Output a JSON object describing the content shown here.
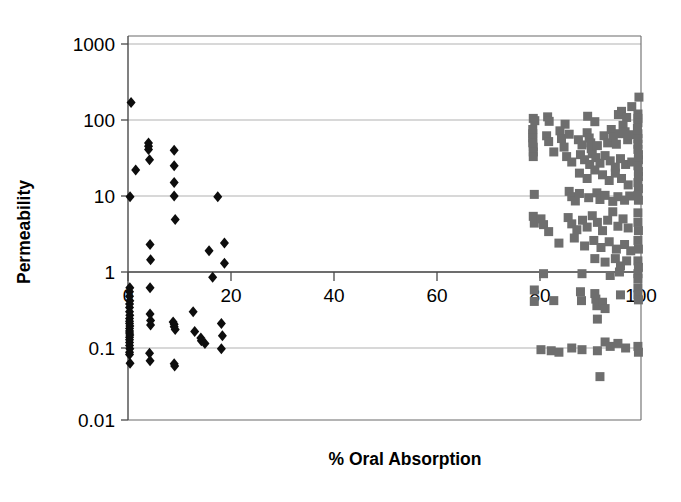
{
  "chart_data": {
    "type": "scatter",
    "title": "",
    "xlabel": "% Oral Absorption",
    "ylabel": "Permeability",
    "xlim": [
      0,
      100
    ],
    "ylim": [
      0.01,
      1000
    ],
    "yscale": "log",
    "xscale": "linear",
    "grid": true,
    "legend": "none",
    "xticks": [
      0,
      20,
      40,
      60,
      80,
      100
    ],
    "xtick_labels": [
      "0",
      "20",
      "40",
      "60",
      "80",
      "100"
    ],
    "yticks": [
      0.01,
      0.1,
      1,
      10,
      100,
      1000
    ],
    "ytick_labels": [
      "0.01",
      "0.1",
      "1",
      "10",
      "100",
      "1000"
    ],
    "series": [
      {
        "name": "low-absorption-compounds",
        "marker": "diamond",
        "color": "#0d0d0d",
        "points": [
          [
            0.6,
            170
          ],
          [
            0.4,
            9.8
          ],
          [
            1.5,
            22
          ],
          [
            4.0,
            50
          ],
          [
            4.0,
            45
          ],
          [
            4.0,
            41
          ],
          [
            4.2,
            30
          ],
          [
            9.0,
            40
          ],
          [
            9.0,
            25
          ],
          [
            9.0,
            15
          ],
          [
            9.0,
            10
          ],
          [
            9.2,
            4.9
          ],
          [
            17.5,
            9.8
          ],
          [
            4.3,
            2.3
          ],
          [
            4.4,
            1.45
          ],
          [
            15.8,
            1.9
          ],
          [
            18.8,
            2.4
          ],
          [
            18.8,
            1.3
          ],
          [
            16.5,
            0.85
          ],
          [
            4.3,
            0.62
          ],
          [
            0.35,
            0.62
          ],
          [
            0.3,
            0.55
          ],
          [
            0.3,
            0.48
          ],
          [
            0.35,
            0.42
          ],
          [
            0.3,
            0.38
          ],
          [
            0.3,
            0.34
          ],
          [
            0.3,
            0.3
          ],
          [
            0.35,
            0.27
          ],
          [
            0.3,
            0.245
          ],
          [
            0.3,
            0.225
          ],
          [
            0.3,
            0.21
          ],
          [
            0.35,
            0.195
          ],
          [
            0.3,
            0.18
          ],
          [
            0.3,
            0.168
          ],
          [
            0.3,
            0.158
          ],
          [
            0.35,
            0.148
          ],
          [
            0.3,
            0.138
          ],
          [
            0.3,
            0.128
          ],
          [
            0.3,
            0.118
          ],
          [
            0.3,
            0.108
          ],
          [
            0.35,
            0.098
          ],
          [
            0.3,
            0.088
          ],
          [
            0.3,
            0.082
          ],
          [
            0.4,
            0.063
          ],
          [
            4.3,
            0.28
          ],
          [
            4.4,
            0.23
          ],
          [
            4.4,
            0.2
          ],
          [
            4.2,
            0.085
          ],
          [
            4.3,
            0.068
          ],
          [
            8.8,
            0.22
          ],
          [
            9.0,
            0.205
          ],
          [
            9.0,
            0.19
          ],
          [
            9.2,
            0.175
          ],
          [
            9.0,
            0.062
          ],
          [
            9.1,
            0.058
          ],
          [
            12.7,
            0.3
          ],
          [
            13.0,
            0.165
          ],
          [
            14.2,
            0.135
          ],
          [
            14.3,
            0.125
          ],
          [
            15.0,
            0.115
          ],
          [
            18.2,
            0.21
          ],
          [
            18.4,
            0.145
          ],
          [
            18.2,
            0.098
          ]
        ]
      },
      {
        "name": "high-absorption-compounds",
        "marker": "square",
        "color": "#6e6e6e",
        "points": [
          [
            99.6,
            200
          ],
          [
            98.2,
            150
          ],
          [
            79.0,
            105
          ],
          [
            79.3,
            98
          ],
          [
            81.8,
            110
          ],
          [
            82.1,
            96
          ],
          [
            85.2,
            88
          ],
          [
            89.6,
            112
          ],
          [
            91.0,
            95
          ],
          [
            95.6,
            118
          ],
          [
            96.2,
            130
          ],
          [
            97.2,
            108
          ],
          [
            99.4,
            120
          ],
          [
            99.4,
            105
          ],
          [
            99.4,
            92
          ],
          [
            78.9,
            75
          ],
          [
            78.9,
            66
          ],
          [
            78.9,
            58
          ],
          [
            78.9,
            50
          ],
          [
            79.0,
            44
          ],
          [
            79.0,
            38
          ],
          [
            79.0,
            33
          ],
          [
            81.6,
            62
          ],
          [
            82.0,
            52
          ],
          [
            84.2,
            72
          ],
          [
            84.5,
            57
          ],
          [
            85.0,
            44
          ],
          [
            86.0,
            65
          ],
          [
            87.8,
            55
          ],
          [
            88.5,
            47
          ],
          [
            89.5,
            68
          ],
          [
            89.9,
            58
          ],
          [
            90.2,
            50
          ],
          [
            90.3,
            42
          ],
          [
            90.5,
            36
          ],
          [
            91.5,
            46
          ],
          [
            92.8,
            62
          ],
          [
            93.5,
            50
          ],
          [
            94.2,
            75
          ],
          [
            94.6,
            60
          ],
          [
            95.2,
            48
          ],
          [
            95.8,
            66
          ],
          [
            96.5,
            85
          ],
          [
            96.9,
            70
          ],
          [
            97.4,
            55
          ],
          [
            98.0,
            64
          ],
          [
            99.3,
            78
          ],
          [
            99.4,
            66
          ],
          [
            99.4,
            57
          ],
          [
            99.4,
            48
          ],
          [
            99.4,
            41
          ],
          [
            99.5,
            35
          ],
          [
            99.5,
            30
          ],
          [
            83.0,
            38
          ],
          [
            85.5,
            33
          ],
          [
            86.5,
            28
          ],
          [
            88.2,
            35
          ],
          [
            89.0,
            30
          ],
          [
            90.0,
            26
          ],
          [
            91.2,
            32
          ],
          [
            92.0,
            27
          ],
          [
            93.0,
            34
          ],
          [
            94.0,
            29
          ],
          [
            95.0,
            24
          ],
          [
            96.0,
            31
          ],
          [
            97.0,
            26
          ],
          [
            98.2,
            28
          ],
          [
            99.4,
            25
          ],
          [
            99.5,
            21
          ],
          [
            99.5,
            18
          ],
          [
            88.0,
            20
          ],
          [
            89.5,
            17
          ],
          [
            91.0,
            22
          ],
          [
            92.5,
            19
          ],
          [
            93.8,
            16
          ],
          [
            95.0,
            20
          ],
          [
            96.2,
            17
          ],
          [
            97.5,
            14
          ],
          [
            99.4,
            15
          ],
          [
            99.5,
            12.5
          ],
          [
            79.2,
            10.5
          ],
          [
            86.0,
            11.5
          ],
          [
            86.5,
            9.8
          ],
          [
            87.2,
            8.6
          ],
          [
            88.0,
            10.8
          ],
          [
            89.8,
            9.5
          ],
          [
            91.4,
            11.0
          ],
          [
            92.0,
            9.0
          ],
          [
            93.0,
            10.2
          ],
          [
            94.5,
            8.5
          ],
          [
            95.5,
            9.8
          ],
          [
            96.8,
            8.8
          ],
          [
            97.8,
            10.0
          ],
          [
            99.4,
            10.2
          ],
          [
            99.5,
            8.8
          ],
          [
            79.0,
            5.4
          ],
          [
            79.2,
            4.4
          ],
          [
            80.5,
            5.0
          ],
          [
            81.0,
            4.2
          ],
          [
            82.0,
            3.4
          ],
          [
            85.8,
            5.2
          ],
          [
            86.5,
            4.3
          ],
          [
            87.5,
            3.6
          ],
          [
            88.6,
            4.8
          ],
          [
            89.5,
            3.9
          ],
          [
            90.5,
            5.5
          ],
          [
            91.5,
            4.5
          ],
          [
            92.5,
            3.5
          ],
          [
            93.5,
            4.8
          ],
          [
            94.5,
            6.2
          ],
          [
            95.5,
            4.0
          ],
          [
            96.5,
            5.0
          ],
          [
            97.5,
            3.8
          ],
          [
            99.4,
            6.0
          ],
          [
            99.4,
            4.5
          ],
          [
            99.5,
            3.5
          ],
          [
            84.0,
            2.4
          ],
          [
            87.0,
            2.8
          ],
          [
            89.0,
            2.2
          ],
          [
            90.8,
            2.6
          ],
          [
            92.2,
            2.1
          ],
          [
            93.8,
            2.5
          ],
          [
            95.2,
            2.0
          ],
          [
            96.8,
            2.3
          ],
          [
            98.0,
            1.9
          ],
          [
            99.4,
            2.6
          ],
          [
            99.5,
            2.0
          ],
          [
            91.0,
            1.5
          ],
          [
            93.0,
            1.35
          ],
          [
            95.0,
            1.5
          ],
          [
            96.0,
            1.2
          ],
          [
            97.2,
            1.4
          ],
          [
            99.4,
            1.4
          ],
          [
            99.5,
            1.15
          ],
          [
            81.0,
            0.95
          ],
          [
            88.5,
            0.95
          ],
          [
            94.0,
            0.9
          ],
          [
            95.8,
            1.0
          ],
          [
            99.4,
            0.95
          ],
          [
            99.4,
            0.82
          ],
          [
            79.2,
            0.58
          ],
          [
            79.2,
            0.41
          ],
          [
            83.0,
            0.42
          ],
          [
            88.2,
            0.55
          ],
          [
            88.4,
            0.42
          ],
          [
            91.0,
            0.52
          ],
          [
            91.2,
            0.44
          ],
          [
            91.4,
            0.36
          ],
          [
            92.5,
            0.4
          ],
          [
            93.0,
            0.33
          ],
          [
            96.0,
            0.5
          ],
          [
            99.4,
            0.62
          ],
          [
            99.4,
            0.5
          ],
          [
            99.5,
            0.43
          ],
          [
            91.5,
            0.24
          ],
          [
            80.5,
            0.095
          ],
          [
            82.5,
            0.092
          ],
          [
            84.0,
            0.088
          ],
          [
            86.5,
            0.1
          ],
          [
            88.5,
            0.095
          ],
          [
            91.5,
            0.092
          ],
          [
            93.0,
            0.12
          ],
          [
            94.0,
            0.105
          ],
          [
            95.5,
            0.115
          ],
          [
            97.0,
            0.1
          ],
          [
            99.4,
            0.105
          ],
          [
            99.5,
            0.088
          ],
          [
            92.0,
            0.042
          ]
        ]
      }
    ]
  }
}
